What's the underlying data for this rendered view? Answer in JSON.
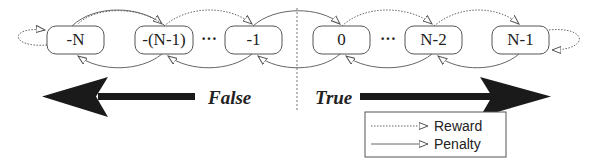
{
  "diagram": {
    "type": "state-transition chain (Tsetlin automaton)",
    "states": [
      {
        "id": "s0",
        "label": "-N"
      },
      {
        "id": "s1",
        "label": "-(N-1)"
      },
      {
        "id": "s2",
        "label": "-1"
      },
      {
        "id": "s3",
        "label": "0"
      },
      {
        "id": "s4",
        "label": "N-2"
      },
      {
        "id": "s5",
        "label": "N-1"
      }
    ],
    "ellipsis": "···",
    "directions": {
      "left": "False",
      "right": "True"
    },
    "legend": {
      "items": [
        {
          "label": "Reward",
          "style": "dotted"
        },
        {
          "label": "Penalty",
          "style": "solid"
        }
      ]
    },
    "colors": {
      "stroke": "#555555",
      "arrow_fill": "#1a1a1a",
      "text": "#222222",
      "background": "#ffffff"
    }
  }
}
